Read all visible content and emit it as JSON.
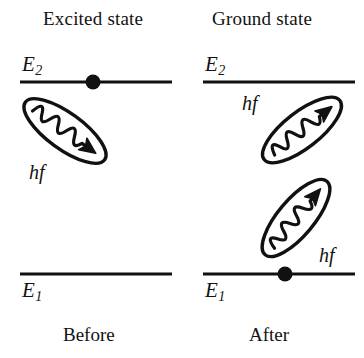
{
  "figure": {
    "title_left": "Excited state",
    "title_right": "Ground state",
    "caption_left": "Before",
    "caption_right": "After"
  },
  "panels": {
    "before": {
      "header": "Excited state",
      "caption": "Before",
      "upper_level_label": "E",
      "upper_level_sub": "2",
      "lower_level_label": "E",
      "lower_level_sub": "1",
      "electron_on_level": "E2",
      "photons": [
        {
          "label": "hf",
          "direction": "down-right",
          "count": 1
        }
      ]
    },
    "after": {
      "header": "Ground state",
      "caption": "After",
      "upper_level_label": "E",
      "upper_level_sub": "2",
      "lower_level_label": "E",
      "lower_level_sub": "1",
      "electron_on_level": "E1",
      "photons": [
        {
          "label": "hf",
          "direction": "up-right",
          "count": 1
        },
        {
          "label": "hf",
          "direction": "up-right",
          "count": 1
        }
      ]
    }
  },
  "labels": {
    "hf_left": "hf",
    "hf_right_upper": "hf",
    "hf_right_lower": "hf",
    "e_symbol": "E",
    "sub_two": "2",
    "sub_one": "1"
  },
  "colors": {
    "ink": "#111111",
    "background": "#ffffff"
  }
}
